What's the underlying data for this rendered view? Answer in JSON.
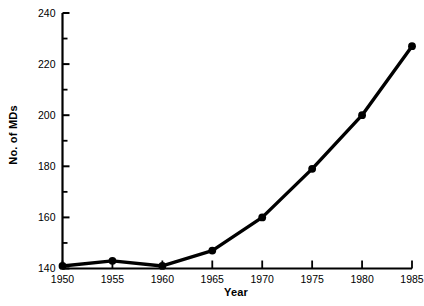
{
  "chart_data": {
    "type": "line",
    "title": "",
    "subtitle": "",
    "xlabel": "Year",
    "ylabel": "No. of MDs",
    "x": [
      1950,
      1955,
      1960,
      1965,
      1970,
      1975,
      1980,
      1985
    ],
    "values": [
      141,
      143,
      141,
      147,
      160,
      179,
      200,
      227
    ],
    "series": [
      {
        "name": "No. of MDs",
        "values": [
          141,
          143,
          141,
          147,
          160,
          179,
          200,
          227
        ]
      }
    ],
    "xlim": [
      1950,
      1985
    ],
    "ylim": [
      140,
      240
    ],
    "xticks": [
      1950,
      1955,
      1960,
      1965,
      1970,
      1975,
      1980,
      1985
    ],
    "xtick_labels": [
      "1950",
      "1955",
      "1960",
      "1965",
      "1970",
      "1975",
      "1980",
      "1985"
    ],
    "yticks": [
      140,
      160,
      180,
      200,
      220,
      240
    ],
    "ytick_labels": [
      "140",
      "160",
      "180",
      "200",
      "220",
      "240"
    ],
    "y_minor_ticks": [
      150,
      170,
      190,
      210,
      230
    ],
    "grid": false,
    "legend": null,
    "legend_position": "none",
    "line_color": "#000000",
    "marker_color": "#000000",
    "marker": "circle",
    "annotations": []
  }
}
